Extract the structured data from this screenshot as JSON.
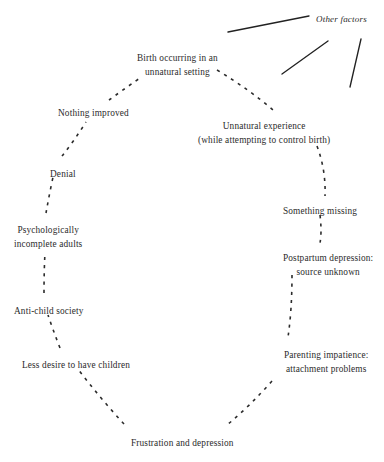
{
  "diagram": {
    "type": "cycle-diagram",
    "title_partially_cropped": "reproductive psychology cycle",
    "background_color": "#ffffff",
    "text_color": "#2b2b2b",
    "edge_style": "dashed",
    "nodes": [
      {
        "id": "birth-unnatural-setting",
        "lines": [
          "Birth occurring in an",
          "unnatural setting"
        ],
        "x": 137,
        "y": 52,
        "align": "center"
      },
      {
        "id": "unnatural-experience",
        "lines": [
          "Unnatural experience",
          "(while attempting to control birth)"
        ],
        "x": 198,
        "y": 120,
        "align": "center"
      },
      {
        "id": "something-missing",
        "lines": [
          "Something missing"
        ],
        "x": 283,
        "y": 205,
        "align": "left"
      },
      {
        "id": "postpartum-depression",
        "lines": [
          "Postpartum depression:",
          "source unknown"
        ],
        "x": 283,
        "y": 252,
        "align": "center"
      },
      {
        "id": "parenting-impatience",
        "lines": [
          "Parenting impatience:",
          "attachment problems"
        ],
        "x": 284,
        "y": 349,
        "align": "center"
      },
      {
        "id": "frustration-depression",
        "lines": [
          "Frustration and depression"
        ],
        "x": 131,
        "y": 437,
        "align": "left"
      },
      {
        "id": "less-desire-children",
        "lines": [
          "Less desire to have children"
        ],
        "x": 22,
        "y": 359,
        "align": "left"
      },
      {
        "id": "anti-child-society",
        "lines": [
          "Anti-child society"
        ],
        "x": 14,
        "y": 305,
        "align": "left"
      },
      {
        "id": "psychologically-incomplete-adults",
        "lines": [
          "Psychologically",
          "incomplete adults"
        ],
        "x": 14,
        "y": 224,
        "align": "center"
      },
      {
        "id": "denial",
        "lines": [
          "Denial"
        ],
        "x": 50,
        "y": 168,
        "align": "left"
      },
      {
        "id": "nothing-improved",
        "lines": [
          "Nothing improved"
        ],
        "x": 58,
        "y": 107,
        "align": "left"
      }
    ],
    "annotation": {
      "id": "other-factors",
      "label": "Other factors",
      "x": 316,
      "y": 14,
      "style": "italic"
    },
    "solid_arrows": [
      {
        "id": "other-factors-line-1",
        "x1": 228,
        "y1": 32,
        "x2": 309,
        "y2": 16
      },
      {
        "id": "other-factors-line-2",
        "x1": 282,
        "y1": 74,
        "x2": 328,
        "y2": 41
      },
      {
        "id": "other-factors-line-3",
        "x1": 361,
        "y1": 39,
        "x2": 350,
        "y2": 87
      }
    ],
    "dashed_edges": [
      {
        "id": "edge-nothing-improved-to-birth",
        "path": "M 109,100 Q 120,92 140,78"
      },
      {
        "id": "edge-denial-to-nothing-improved",
        "path": "M 62,156 Q 74,141 86,122"
      },
      {
        "id": "edge-incomplete-adults-to-denial",
        "path": "M 46,213 Q 49,196 53,177"
      },
      {
        "id": "edge-anti-child-to-incomplete-adults",
        "path": "M 44,293 Q 44,272 45,252"
      },
      {
        "id": "edge-less-desire-to-anti-child",
        "path": "M 60,348 Q 53,330 48,315"
      },
      {
        "id": "edge-frustration-to-less-desire",
        "path": "M 124,424 Q 100,398 78,369"
      },
      {
        "id": "edge-parenting-to-frustration",
        "path": "M 272,381 Q 250,406 227,425"
      },
      {
        "id": "edge-postpartum-to-parenting",
        "path": "M 292,275 Q 292,310 288,337"
      },
      {
        "id": "edge-something-missing-to-postpartum",
        "path": "M 320,215 Q 322,232 320,243"
      },
      {
        "id": "edge-unnatural-exp-to-something-missing",
        "path": "M 317,146 Q 326,170 325,196"
      },
      {
        "id": "edge-birth-to-unnatural-exp",
        "path": "M 217,70 Q 250,90 273,110"
      }
    ]
  }
}
